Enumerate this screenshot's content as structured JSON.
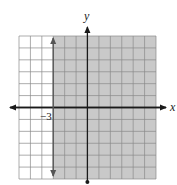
{
  "chart_data": {
    "type": "inequality-graph",
    "title": "",
    "inequality": "x ≥ -3",
    "boundary": {
      "type": "vertical-line",
      "x": -3,
      "style": "solid"
    },
    "shaded_region": "x >= -3",
    "xlabel": "x",
    "ylabel": "y",
    "xlim": [
      -6,
      6
    ],
    "ylim": [
      -6,
      6
    ],
    "grid": true,
    "tick_labels": [
      {
        "value": -3,
        "axis": "x",
        "text": "−3"
      }
    ]
  },
  "axes": {
    "x_label": "x",
    "y_label": "y",
    "tick_label": "−3"
  },
  "colors": {
    "shade": "#c9c9c9",
    "grid": "#8a8a8a",
    "axis": "#1a1a1a",
    "boundary": "#555555"
  }
}
